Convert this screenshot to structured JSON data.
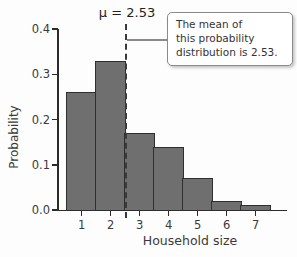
{
  "figure": {
    "mean_label": "μ = 2.53",
    "callout_lines": [
      "The mean of",
      "this probability",
      "distribution is 2.53."
    ]
  },
  "chart_data": {
    "type": "bar",
    "title": "",
    "categories": [
      "1",
      "2",
      "3",
      "4",
      "5",
      "6",
      "7"
    ],
    "values": [
      0.26,
      0.33,
      0.17,
      0.14,
      0.07,
      0.02,
      0.01
    ],
    "xlabel": "Household size",
    "ylabel": "Probability",
    "ylim": [
      0,
      0.4
    ],
    "ytick_labels": [
      "0.0",
      "0.1",
      "0.2",
      "0.3",
      "0.4"
    ],
    "ytick_values": [
      0,
      0.1,
      0.2,
      0.3,
      0.4
    ],
    "grid": false,
    "legend": false,
    "mean": 2.53,
    "mean_label": "μ = 2.53",
    "annotation": "The mean of this probability distribution is 2.53.",
    "colors": {
      "bar_fill": "#6f6f6f",
      "bar_border": "#2f2f2f",
      "axis": "#2b2b2b",
      "mean_line": "#3a3a3a",
      "callout_border": "#8a8a8a"
    }
  }
}
